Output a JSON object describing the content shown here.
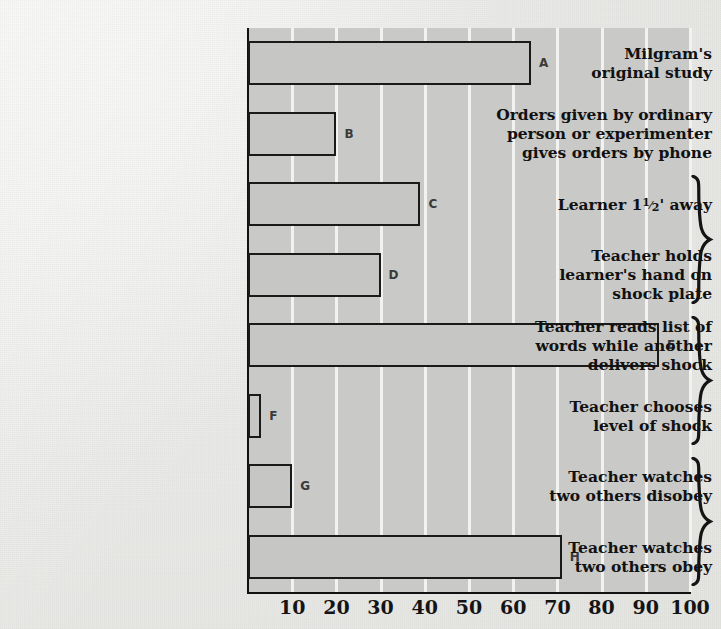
{
  "chart_data": {
    "type": "bar",
    "orientation": "horizontal",
    "title": "",
    "subtitle": "",
    "xlabel": "",
    "ylabel": "",
    "xlim": [
      0,
      100
    ],
    "grid": true,
    "legend": false,
    "categories": [
      "Milgram's original study",
      "Orders given by ordinary person or experimenter gives orders by phone",
      "Learner 1 1/2' away",
      "Teacher holds learner's hand on shock plate",
      "Teacher reads list of words while another delivers shock",
      "Teacher chooses level of shock",
      "Teacher watches two others disobey",
      "Teacher watches two others obey"
    ],
    "point_labels": [
      "A",
      "B",
      "C",
      "D",
      "E",
      "F",
      "G",
      "H"
    ],
    "values": [
      64,
      20,
      39,
      30,
      93,
      3,
      10,
      71
    ],
    "xticks": [
      10,
      20,
      30,
      40,
      50,
      60,
      70,
      80,
      90,
      100
    ],
    "xtick_labels": [
      "10",
      "20",
      "30",
      "40",
      "50",
      "60",
      "70",
      "80",
      "90",
      "100"
    ],
    "colors": {
      "bar_fill": "#c6c6c4",
      "bar_edge": "#1a1a1a",
      "plot_background": "#c9c9c7",
      "gridline": "#f2f2f0",
      "page_background": "#e9e9e7",
      "text": "#111111"
    }
  },
  "labels": [
    {
      "lines": [
        "Milgram's",
        "original study"
      ]
    },
    {
      "lines": [
        "Orders given by ordinary",
        "person or experimenter",
        "gives orders by phone"
      ]
    },
    {
      "lines": [
        "Learner 1FRAC' away"
      ],
      "fraction": {
        "numerator": "1",
        "denominator": "2"
      }
    },
    {
      "lines": [
        "Teacher holds",
        "learner's hand on",
        "shock plate"
      ]
    },
    {
      "lines": [
        "Teacher reads list of",
        "words while another",
        "delivers shock"
      ]
    },
    {
      "lines": [
        "Teacher chooses",
        "level of shock"
      ]
    },
    {
      "lines": [
        "Teacher watches",
        "two others disobey"
      ]
    },
    {
      "lines": [
        "Teacher watches",
        "two others obey"
      ]
    }
  ],
  "braces": [
    {
      "name": "brace-learner-proximity"
    },
    {
      "name": "brace-shared-responsibility"
    },
    {
      "name": "brace-group-influence"
    }
  ]
}
